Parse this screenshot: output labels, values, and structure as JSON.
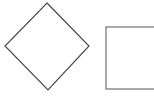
{
  "diagram": {
    "background": "#ffffff",
    "shapes": [
      {
        "id": "diamond",
        "kind": "decision",
        "label": "",
        "points": [
          [
            47,
            3
          ],
          [
            89,
            46
          ],
          [
            48,
            90
          ],
          [
            5,
            46
          ]
        ],
        "stroke": "#4a4a4a",
        "fill": "#ffffff",
        "stroke_width": 1.2
      },
      {
        "id": "rectangle",
        "kind": "process",
        "label": "",
        "x": 106,
        "y": 27,
        "width": 60,
        "height": 62,
        "stroke": "#707070",
        "fill": "#ffffff",
        "stroke_width": 1.2
      }
    ]
  }
}
